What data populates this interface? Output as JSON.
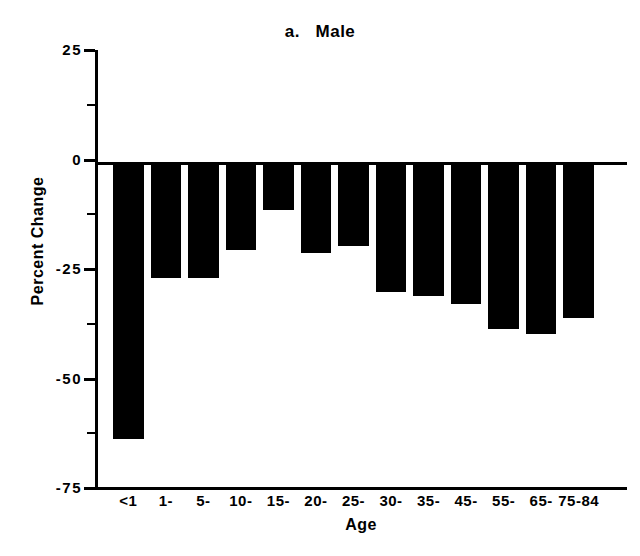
{
  "chart_data": {
    "type": "bar",
    "title": "a.   Male",
    "xlabel": "Age",
    "ylabel": "Percent Change",
    "categories": [
      "<1",
      "1-",
      "5-",
      "10-",
      "15-",
      "20-",
      "25-",
      "30-",
      "35-",
      "45-",
      "55-",
      "65-",
      "75-84"
    ],
    "values": [
      -62.8,
      -26.0,
      -26.0,
      -19.6,
      -10.4,
      -20.3,
      -18.7,
      -29.3,
      -30.2,
      -32.0,
      -37.6,
      -38.8,
      -35.1
    ],
    "ylim": [
      -75,
      25
    ],
    "yticks": [
      25,
      0,
      -25,
      -50,
      -75
    ],
    "ytick_labels": [
      "25",
      "0",
      "-25",
      "-50",
      "-75"
    ],
    "yticks_minor": [
      12.5,
      -12.5,
      -37.5,
      -62.5
    ],
    "grid": false,
    "legend": null,
    "bar_color": "#000000",
    "axis_color": "#000000"
  },
  "figure": {
    "panel_letter": "a.",
    "panel_name": "Male"
  }
}
